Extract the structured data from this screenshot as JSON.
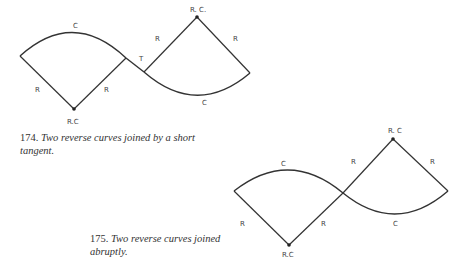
{
  "figures": [
    {
      "id": "174",
      "caption_number": "174.",
      "caption_text": "Two reverse curves joined by a short tangent.",
      "labels": {
        "left_arc": "C",
        "right_arc": "C",
        "left_center": "R.C",
        "right_center": "R. C.",
        "tangent": "T",
        "left_radius_1": "R",
        "left_radius_2": "R",
        "right_radius_1": "R",
        "right_radius_2": "R"
      }
    },
    {
      "id": "175",
      "caption_number": "175.",
      "caption_text": "Two reverse curves joined abruptly.",
      "labels": {
        "left_arc": "C",
        "right_arc": "C",
        "left_center": "R.C",
        "right_center": "R. C",
        "left_radius_1": "R",
        "left_radius_2": "R",
        "right_radius_1": "R",
        "right_radius_2": "R"
      }
    }
  ],
  "colors": {
    "line": "#333333",
    "label": "#444444",
    "caption": "#333333"
  }
}
